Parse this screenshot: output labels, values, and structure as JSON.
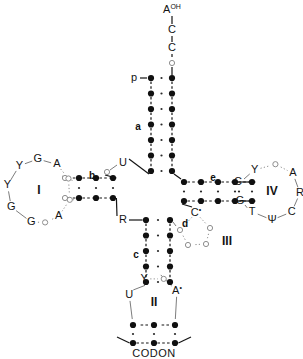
{
  "figure": {
    "codon_label": "CODON"
  },
  "colors": {
    "nucleotide_filled": "#101010",
    "nucleotide_open": "#ffffff",
    "open_stroke": "#8e8e8e",
    "line": "#141414",
    "faint_line": "#8e8e8e",
    "background": "#ffffff"
  },
  "arm_labels": [
    {
      "id": "a",
      "label": "a",
      "x": 138,
      "y": 127,
      "desc": "acceptor-stem"
    },
    {
      "id": "b",
      "label": "b",
      "x": 92,
      "y": 176,
      "desc": "dihydrouridine-stem"
    },
    {
      "id": "c",
      "label": "c",
      "x": 136,
      "y": 255,
      "desc": "anticodon-stem"
    },
    {
      "id": "d",
      "label": "d",
      "x": 185,
      "y": 224,
      "desc": "variable-stem"
    },
    {
      "id": "e",
      "label": "e",
      "x": 213,
      "y": 178,
      "desc": "tpsic-stem"
    }
  ],
  "loop_labels": [
    {
      "id": "I",
      "label": "I",
      "x": 39,
      "y": 191,
      "desc": "dihydrouridine-loop"
    },
    {
      "id": "II",
      "label": "II",
      "x": 154,
      "y": 300,
      "desc": "anticodon-loop"
    },
    {
      "id": "III",
      "label": "III",
      "x": 227,
      "y": 242,
      "desc": "variable-loop"
    },
    {
      "id": "IV",
      "label": "IV",
      "x": 272,
      "y": 192,
      "desc": "tpsic-loop"
    }
  ],
  "terminal": {
    "acceptor_end": [
      {
        "text": "A",
        "sup": "OH",
        "x": 172,
        "y": 10,
        "type": "letter"
      },
      {
        "text": "C",
        "sup": "",
        "x": 172,
        "y": 30,
        "type": "letter"
      },
      {
        "text": "C",
        "sup": "",
        "x": 172,
        "y": 48,
        "type": "letter"
      },
      {
        "text": "",
        "sup": "",
        "x": 172,
        "y": 63,
        "type": "open-circle"
      }
    ],
    "phosphate": {
      "text": "p",
      "x": 134,
      "y": 78
    }
  },
  "acceptor_stem": {
    "pairs": 7,
    "left_x": 151,
    "right_x": 172,
    "top_y": 78,
    "spacing": 15.5
  },
  "anticodon_stem": {
    "pairs": 5,
    "left_x": 146,
    "right_x": 170,
    "top_y": 220,
    "spacing": 15.5
  },
  "d_stem": {
    "pairs": 3,
    "top_y": 178,
    "bottom_y": 198,
    "start_x": 79,
    "spacing": 17
  },
  "t_stem": {
    "pairs": 5,
    "top_y": 182,
    "bottom_y": 201,
    "start_x": 184,
    "spacing": 17
  },
  "d_loop": {
    "center_x": 39,
    "center_y": 191,
    "radius": 32,
    "nucleotides": [
      {
        "text": "Y",
        "angle": 232,
        "type": "letter"
      },
      {
        "text": "G",
        "angle": 268,
        "type": "letter"
      },
      {
        "text": "A",
        "angle": 304,
        "type": "letter"
      },
      {
        "text": "",
        "angle": 337,
        "type": "open-circle"
      },
      {
        "text": "",
        "angle": 16,
        "type": "open-circle"
      },
      {
        "text": "A",
        "angle": 52,
        "type": "letter"
      },
      {
        "text": "",
        "angle": 79,
        "type": "open-circle"
      },
      {
        "text": "G",
        "angle": 104,
        "type": "letter"
      },
      {
        "text": "G",
        "angle": 150,
        "type": "letter"
      },
      {
        "text": "Y",
        "angle": 190,
        "type": "letter"
      }
    ]
  },
  "t_loop": {
    "center_x": 272,
    "center_y": 192,
    "radius": 28,
    "nucleotides": [
      {
        "text": "Y",
        "angle": 232,
        "type": "letter"
      },
      {
        "text": "",
        "angle": 277,
        "type": "open-circle"
      },
      {
        "text": "A",
        "angle": 318,
        "type": "letter"
      },
      {
        "text": "R",
        "angle": 2,
        "type": "letter"
      },
      {
        "text": "C",
        "angle": 45,
        "type": "letter"
      },
      {
        "text": "Ψ",
        "angle": 90,
        "type": "letter"
      },
      {
        "text": "T",
        "angle": 135,
        "type": "letter"
      }
    ],
    "stem_top": {
      "text": "C",
      "x": 238,
      "y": 182
    },
    "stem_bottom": {
      "text": "G",
      "x": 240,
      "y": 201
    }
  },
  "variable_loop": {
    "nucleotides": [
      {
        "text": "C",
        "sup": "•",
        "x": 196,
        "y": 213,
        "type": "letter"
      },
      {
        "text": "",
        "x": 210,
        "y": 228,
        "type": "open-circle"
      },
      {
        "text": "",
        "x": 206,
        "y": 244,
        "type": "open-circle"
      },
      {
        "text": "",
        "x": 188,
        "y": 245,
        "type": "open-circle"
      },
      {
        "text": "",
        "x": 180,
        "y": 230,
        "type": "open-circle"
      }
    ]
  },
  "junction": {
    "u_residue": {
      "text": "U",
      "x": 123,
      "y": 163
    },
    "u_circle": {
      "x": 107,
      "y": 172
    },
    "r_residue": {
      "text": "R",
      "x": 123,
      "y": 220
    }
  },
  "anticodon_loop": {
    "center_x": 154,
    "center_y": 303,
    "radius": 26,
    "nucleotides": [
      {
        "text": "Y",
        "sup": "",
        "angle": 248,
        "type": "letter"
      },
      {
        "text": "",
        "sup": "",
        "angle": 292,
        "type": "open-circle"
      },
      {
        "text": "A",
        "sup": "•",
        "angle": 332,
        "type": "letter"
      },
      {
        "text": "",
        "sup": "",
        "angle": 40,
        "type": "anticodon-dot"
      },
      {
        "text": "",
        "sup": "",
        "angle": 90,
        "type": "anticodon-dot"
      },
      {
        "text": "",
        "sup": "",
        "angle": 140,
        "type": "anticodon-dot"
      },
      {
        "text": "U",
        "sup": "",
        "angle": 198,
        "type": "letter"
      }
    ]
  },
  "codon": {
    "anticodon_y": 325,
    "codon_y": 343,
    "xs": [
      133,
      154,
      175
    ],
    "label_x": 154,
    "label_y": 354
  }
}
